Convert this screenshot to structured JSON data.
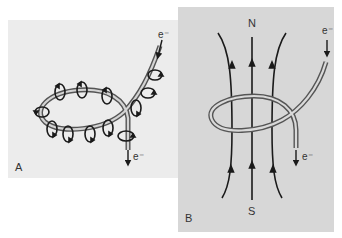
{
  "colors": {
    "page_bg": "#ffffff",
    "panel_a_bg": "#ececec",
    "panel_b_bg": "#d7d7d7",
    "wire_outer": "#555555",
    "wire_inner": "#d0d0d0",
    "line": "#1a1a1a"
  },
  "panel_a": {
    "label": "A",
    "electron_in": "e⁻",
    "electron_out": "e⁻",
    "description": "Current-carrying wire loop with circular magnetic field arrows around the wire"
  },
  "panel_b": {
    "label": "B",
    "pole_top": "N",
    "pole_bottom": "S",
    "electron_in": "e⁻",
    "electron_out": "e⁻",
    "description": "Wire loop with magnetic field lines passing through from S to N"
  }
}
